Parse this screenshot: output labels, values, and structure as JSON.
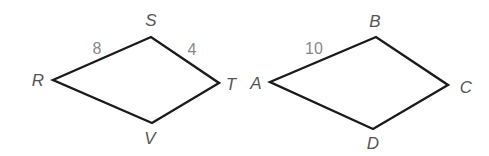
{
  "figures": [
    {
      "name": "RSTV",
      "vertices": [
        {
          "label": "R",
          "x": 53,
          "y": 80,
          "lx": 38,
          "ly": 86
        },
        {
          "label": "S",
          "x": 151,
          "y": 37,
          "lx": 151,
          "ly": 26
        },
        {
          "label": "T",
          "x": 219,
          "y": 83,
          "lx": 231,
          "ly": 90
        },
        {
          "label": "V",
          "x": 152,
          "y": 123,
          "lx": 150,
          "ly": 144
        }
      ],
      "side_labels": [
        {
          "text": "8",
          "side": "RS",
          "x": 97,
          "y": 54
        },
        {
          "text": "4",
          "side": "ST",
          "x": 192,
          "y": 55
        }
      ]
    },
    {
      "name": "ABCD",
      "vertices": [
        {
          "label": "A",
          "x": 270,
          "y": 82,
          "lx": 256,
          "ly": 89
        },
        {
          "label": "B",
          "x": 376,
          "y": 37,
          "lx": 375,
          "ly": 27
        },
        {
          "label": "C",
          "x": 448,
          "y": 85,
          "lx": 466,
          "ly": 93
        },
        {
          "label": "D",
          "x": 373,
          "y": 129,
          "lx": 373,
          "ly": 149
        }
      ],
      "side_labels": [
        {
          "text": "10",
          "side": "AB",
          "x": 314,
          "y": 54
        }
      ]
    }
  ],
  "text": {
    "R": "R",
    "S": "S",
    "T": "T",
    "V": "V",
    "A": "A",
    "B": "B",
    "C": "C",
    "D": "D",
    "RS": "8",
    "ST": "4",
    "AB": "10"
  }
}
